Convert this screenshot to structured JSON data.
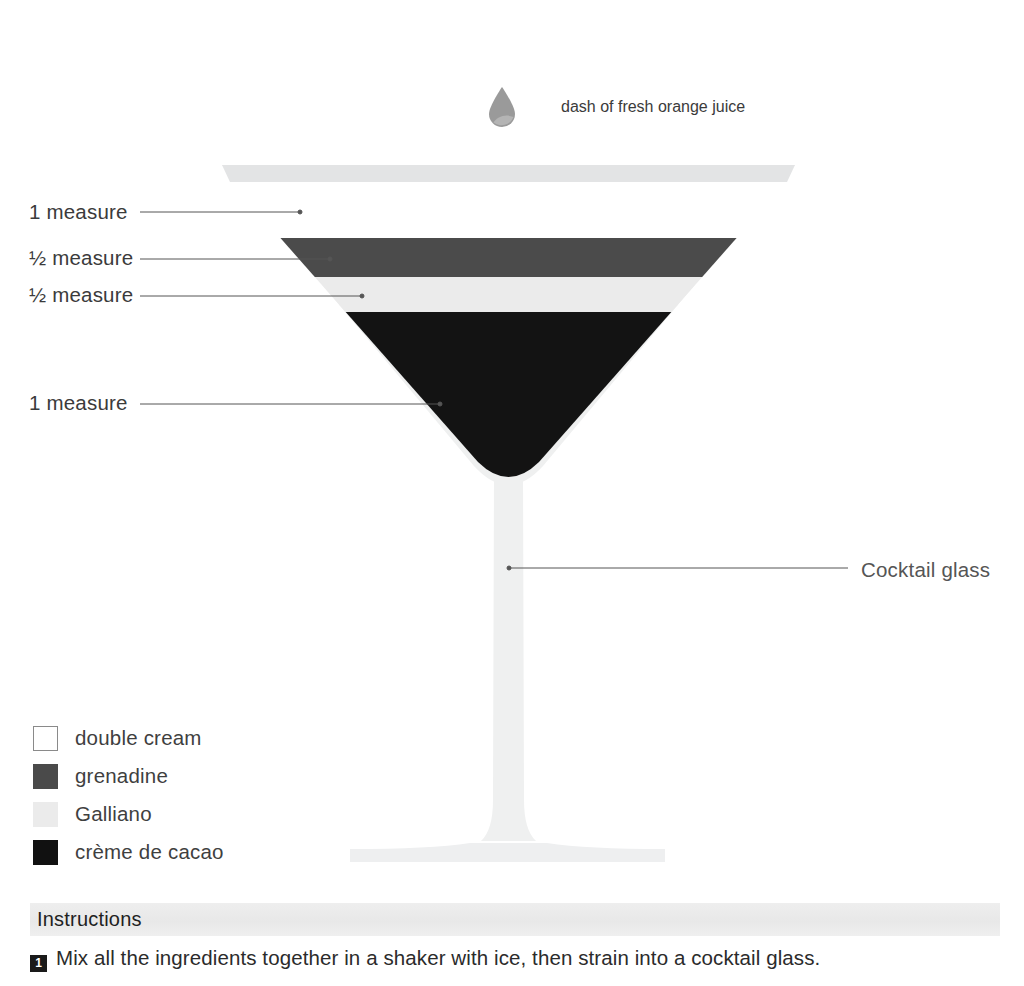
{
  "garnish": {
    "icon": "droplet-icon",
    "label": "dash of fresh orange juice",
    "color": "#9a9a9a"
  },
  "glass": {
    "label": "Cocktail glass",
    "glass_color": "#eff0f0",
    "rim_color": "#e4e5e6",
    "rim_left_x": 222,
    "rim_right_x": 795,
    "rim_y": 165,
    "bowl_bottom_y": 481,
    "stem_top_y": 481,
    "stem_bottom_y": 845,
    "base_left_x": 350,
    "base_right_x": 665,
    "base_y": 845
  },
  "measures": [
    {
      "amount": "1 measure",
      "ingredient": "double cream",
      "color": "#ffffff",
      "label_y": 202,
      "leader_y": 212,
      "leader_x_start": 140,
      "leader_x_end": 300
    },
    {
      "amount": "½ measure",
      "ingredient": "grenadine",
      "color": "#4b4b4b",
      "label_y": 248,
      "leader_y": 259,
      "leader_x_start": 140,
      "leader_x_end": 330
    },
    {
      "amount": "½ measure",
      "ingredient": "Galliano",
      "color": "#ebebeb",
      "label_y": 285,
      "leader_y": 296,
      "leader_x_start": 140,
      "leader_x_end": 362
    },
    {
      "amount": "1 measure",
      "ingredient": "crème de cacao",
      "color": "#111111",
      "label_y": 393,
      "leader_y": 404,
      "leader_x_start": 140,
      "leader_x_end": 440
    }
  ],
  "layers": [
    {
      "name": "double cream",
      "color": "#ffffff",
      "top_y": 182,
      "bottom_y": 238
    },
    {
      "name": "grenadine",
      "color": "#4b4b4b",
      "top_y": 238,
      "bottom_y": 277
    },
    {
      "name": "Galliano",
      "color": "#ebebeb",
      "top_y": 277,
      "bottom_y": 312
    },
    {
      "name": "crème de cacao",
      "color": "#131313",
      "top_y": 312,
      "bottom_y": 478
    }
  ],
  "legend": {
    "items": [
      {
        "label": "double cream",
        "color": "#ffffff",
        "border": "#8a8a8a"
      },
      {
        "label": "grenadine",
        "color": "#4a4a4a",
        "border": "#4a4a4a"
      },
      {
        "label": "Galliano",
        "color": "#ebebeb",
        "border": "#ebebeb"
      },
      {
        "label": "crème de cacao",
        "color": "#111111",
        "border": "#111111"
      }
    ]
  },
  "instructions": {
    "heading": "Instructions",
    "steps": [
      {
        "number": "1",
        "text": "Mix all the ingredients together in a shaker with ice, then strain into a cocktail glass."
      }
    ]
  },
  "leader_line_color": "#555555"
}
